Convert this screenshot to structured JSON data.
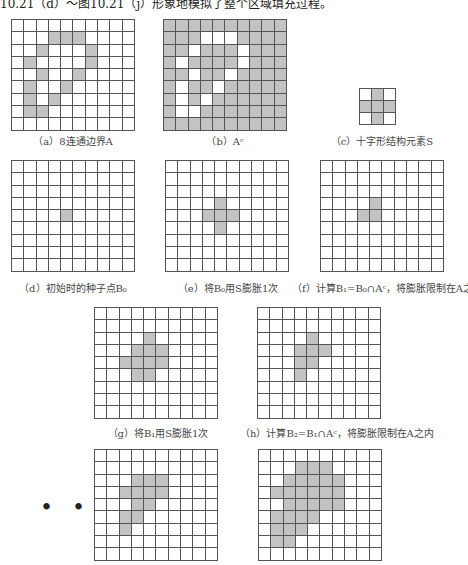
{
  "heading": "10.21（d）～图10.21（j）形象地模拟了整个区域填充过程。",
  "colors": {
    "filled": "#c3c3c3",
    "empty": "#ffffff",
    "line": "#555555"
  },
  "figures": [
    {
      "id": "a",
      "caption": "（a）8连通边界A",
      "rows": 9,
      "cols": 10,
      "filled": [
        [
          1,
          3
        ],
        [
          1,
          4
        ],
        [
          1,
          5
        ],
        [
          2,
          2
        ],
        [
          2,
          6
        ],
        [
          3,
          1
        ],
        [
          3,
          6
        ],
        [
          4,
          2
        ],
        [
          4,
          5
        ],
        [
          5,
          1
        ],
        [
          5,
          4
        ],
        [
          6,
          1
        ],
        [
          6,
          3
        ],
        [
          7,
          1
        ],
        [
          7,
          2
        ]
      ],
      "invert": false
    },
    {
      "id": "b",
      "caption": "（b）Aᶜ",
      "rows": 9,
      "cols": 10,
      "filled": [
        [
          1,
          3
        ],
        [
          1,
          4
        ],
        [
          1,
          5
        ],
        [
          2,
          2
        ],
        [
          2,
          6
        ],
        [
          3,
          1
        ],
        [
          3,
          6
        ],
        [
          4,
          2
        ],
        [
          4,
          5
        ],
        [
          5,
          1
        ],
        [
          5,
          4
        ],
        [
          6,
          1
        ],
        [
          6,
          3
        ],
        [
          7,
          1
        ],
        [
          7,
          2
        ]
      ],
      "invert": true
    },
    {
      "id": "c",
      "caption": "（c）十字形结构元素S",
      "rows": 3,
      "cols": 3,
      "filled": [
        [
          0,
          1
        ],
        [
          1,
          0
        ],
        [
          1,
          1
        ],
        [
          1,
          2
        ],
        [
          2,
          1
        ]
      ],
      "invert": false
    },
    {
      "id": "d",
      "caption": "（d）初始时的种子点B₀",
      "rows": 9,
      "cols": 10,
      "filled": [
        [
          4,
          4
        ]
      ],
      "invert": false
    },
    {
      "id": "e",
      "caption": "（e）将B₀用S膨胀1次",
      "rows": 9,
      "cols": 10,
      "filled": [
        [
          3,
          4
        ],
        [
          4,
          3
        ],
        [
          4,
          4
        ],
        [
          4,
          5
        ],
        [
          5,
          4
        ]
      ],
      "invert": false
    },
    {
      "id": "f",
      "caption": "（f）计算B₁=B₀∩Aᶜ，将膨胀限制在A之内",
      "rows": 9,
      "cols": 10,
      "filled": [
        [
          3,
          4
        ],
        [
          4,
          3
        ],
        [
          4,
          4
        ]
      ],
      "invert": false
    },
    {
      "id": "g",
      "caption": "（g）将B₁用S膨胀1次",
      "rows": 9,
      "cols": 10,
      "filled": [
        [
          2,
          4
        ],
        [
          3,
          3
        ],
        [
          3,
          4
        ],
        [
          3,
          5
        ],
        [
          4,
          2
        ],
        [
          4,
          3
        ],
        [
          4,
          4
        ],
        [
          4,
          5
        ],
        [
          5,
          3
        ],
        [
          5,
          4
        ]
      ],
      "invert": false
    },
    {
      "id": "h",
      "caption": "（h）计算B₂=B₁∩Aᶜ，将膨胀限制在A之内",
      "rows": 9,
      "cols": 10,
      "filled": [
        [
          2,
          4
        ],
        [
          3,
          3
        ],
        [
          3,
          4
        ],
        [
          3,
          5
        ],
        [
          4,
          3
        ],
        [
          4,
          4
        ],
        [
          5,
          3
        ]
      ],
      "invert": false
    },
    {
      "id": "i",
      "caption": "",
      "rows": 9,
      "cols": 10,
      "filled": [
        [
          2,
          3
        ],
        [
          2,
          4
        ],
        [
          2,
          5
        ],
        [
          3,
          2
        ],
        [
          3,
          3
        ],
        [
          3,
          4
        ],
        [
          3,
          5
        ],
        [
          4,
          3
        ],
        [
          4,
          4
        ],
        [
          5,
          2
        ],
        [
          5,
          3
        ],
        [
          6,
          2
        ]
      ],
      "invert": false
    },
    {
      "id": "j",
      "caption": "",
      "rows": 9,
      "cols": 10,
      "filled": [
        [
          1,
          3
        ],
        [
          1,
          4
        ],
        [
          1,
          5
        ],
        [
          2,
          2
        ],
        [
          2,
          3
        ],
        [
          2,
          4
        ],
        [
          2,
          5
        ],
        [
          2,
          6
        ],
        [
          3,
          1
        ],
        [
          3,
          2
        ],
        [
          3,
          3
        ],
        [
          3,
          4
        ],
        [
          3,
          5
        ],
        [
          3,
          6
        ],
        [
          4,
          2
        ],
        [
          4,
          3
        ],
        [
          4,
          4
        ],
        [
          4,
          5
        ],
        [
          4,
          6
        ],
        [
          5,
          1
        ],
        [
          5,
          2
        ],
        [
          5,
          3
        ],
        [
          5,
          4
        ],
        [
          6,
          1
        ],
        [
          6,
          2
        ],
        [
          6,
          3
        ],
        [
          7,
          1
        ],
        [
          7,
          2
        ]
      ],
      "invert": false
    }
  ],
  "ellipsis": "• • •"
}
